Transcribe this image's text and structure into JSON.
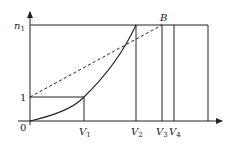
{
  "diagram": {
    "colors": {
      "line": "#222222",
      "background": "#ffffff"
    },
    "labels": {
      "origin": "0",
      "y_one": "1",
      "n_main": "n",
      "n_sub": "1",
      "point_B": "B",
      "v1_main": "V",
      "v1_sub": "1",
      "v2_main": "V",
      "v2_sub": "2",
      "v3_main": "V",
      "v3_sub": "3",
      "v4_main": "V",
      "v4_sub": "4"
    },
    "elements": [
      "x-axis with arrow",
      "y-axis with arrow",
      "horizontal line at n1",
      "horizontal line at 1 up to V1",
      "solid curve from origin through (V1,1) to (V2,n1)",
      "dashed line from (0,1) to B",
      "vertical lines at V1, V2, V3, V4 and right boundary"
    ]
  }
}
